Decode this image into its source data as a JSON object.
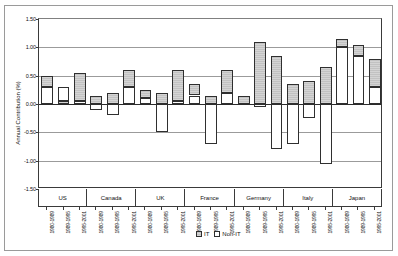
{
  "chart_data": {
    "type": "bar",
    "subtype": "stacked-column-grouped",
    "title": "",
    "xlabel": "",
    "ylabel": "Annual Contribution (%)",
    "ylim": [
      -1.5,
      1.5
    ],
    "ytick_values": [
      1.5,
      1.0,
      0.5,
      0.0,
      -0.5,
      -1.0,
      -1.5
    ],
    "ytick_labels": [
      "1.50",
      "1.00",
      "0.50",
      "0.00",
      "-0.50",
      "-1.00",
      "-1.50"
    ],
    "grid": true,
    "legend_position": "bottom-center",
    "legend": [
      "IT",
      "Non-IT"
    ],
    "colors": {
      "IT": "#c2c2c2",
      "Non-IT": "#ffffff",
      "outline": "#2f2f2f",
      "gridline": "#9b9b9b",
      "axis": "#3a3a3a"
    },
    "categories": [
      "US",
      "Canada",
      "UK",
      "France",
      "Germany",
      "Italy",
      "Japan"
    ],
    "periods": [
      "1980-1989",
      "1989-1995",
      "1995-2001"
    ],
    "series": [
      {
        "name": "IT",
        "values": [
          [
            0.2,
            0.05,
            0.05
          ],
          [
            0.15,
            0.2,
            0.3
          ],
          [
            0.15,
            0.2,
            0.55
          ],
          [
            0.2,
            0.15,
            0.4
          ],
          [
            0.15,
            1.1,
            0.15
          ],
          [
            0.35,
            0.4,
            0.65
          ],
          [
            0.15,
            0.2,
            0.5
          ]
        ]
      },
      {
        "name": "Non-IT",
        "values": [
          [
            0.3,
            0.25,
            0.5
          ],
          [
            -0.1,
            -0.2,
            0.3
          ],
          [
            0.1,
            -0.5,
            0.05
          ],
          [
            0.15,
            -0.7,
            0.2
          ],
          [
            0.0,
            -0.05,
            -0.8
          ],
          [
            -0.7,
            -0.25,
            -1.05
          ],
          [
            1.0,
            0.85,
            0.3
          ]
        ]
      }
    ],
    "bars": [
      {
        "country": "US",
        "period": "1980-1989",
        "it_bottom": 0.3,
        "it_top": 0.5,
        "nonit_bottom": 0.0,
        "nonit_top": 0.3
      },
      {
        "country": "US",
        "period": "1989-1995",
        "it_bottom": 0.0,
        "it_top": 0.05,
        "nonit_bottom": 0.05,
        "nonit_top": 0.3
      },
      {
        "country": "US",
        "period": "1995-2001",
        "it_bottom": 0.05,
        "it_top": 0.55,
        "nonit_bottom": 0.0,
        "nonit_top": 0.05
      },
      {
        "country": "Canada",
        "period": "1980-1989",
        "it_bottom": 0.0,
        "it_top": 0.15,
        "nonit_bottom": -0.1,
        "nonit_top": 0.0
      },
      {
        "country": "Canada",
        "period": "1989-1995",
        "it_bottom": 0.0,
        "it_top": 0.2,
        "nonit_bottom": -0.2,
        "nonit_top": 0.0
      },
      {
        "country": "Canada",
        "period": "1995-2001",
        "it_bottom": 0.3,
        "it_top": 0.6,
        "nonit_bottom": 0.0,
        "nonit_top": 0.3
      },
      {
        "country": "UK",
        "period": "1980-1989",
        "it_bottom": 0.1,
        "it_top": 0.25,
        "nonit_bottom": 0.0,
        "nonit_top": 0.1
      },
      {
        "country": "UK",
        "period": "1989-1995",
        "it_bottom": 0.0,
        "it_top": 0.2,
        "nonit_bottom": -0.5,
        "nonit_top": 0.0
      },
      {
        "country": "UK",
        "period": "1995-2001",
        "it_bottom": 0.05,
        "it_top": 0.6,
        "nonit_bottom": 0.0,
        "nonit_top": 0.05
      },
      {
        "country": "France",
        "period": "1980-1989",
        "it_bottom": 0.15,
        "it_top": 0.35,
        "nonit_bottom": 0.0,
        "nonit_top": 0.15
      },
      {
        "country": "France",
        "period": "1989-1995",
        "it_bottom": 0.0,
        "it_top": 0.15,
        "nonit_bottom": -0.7,
        "nonit_top": 0.0
      },
      {
        "country": "France",
        "period": "1995-2001",
        "it_bottom": 0.2,
        "it_top": 0.6,
        "nonit_bottom": 0.0,
        "nonit_top": 0.2
      },
      {
        "country": "Germany",
        "period": "1980-1989",
        "it_bottom": 0.0,
        "it_top": 0.15,
        "nonit_bottom": 0.0,
        "nonit_top": 0.0
      },
      {
        "country": "Germany",
        "period": "1989-1995",
        "it_bottom": 0.0,
        "it_top": 1.1,
        "nonit_bottom": -0.05,
        "nonit_top": 0.0
      },
      {
        "country": "Germany",
        "period": "1995-2001",
        "it_bottom": 0.0,
        "it_top": 0.85,
        "nonit_bottom": -0.8,
        "nonit_top": 0.0
      },
      {
        "country": "Italy",
        "period": "1980-1989",
        "it_bottom": 0.0,
        "it_top": 0.35,
        "nonit_bottom": -0.7,
        "nonit_top": 0.0
      },
      {
        "country": "Italy",
        "period": "1989-1995",
        "it_bottom": 0.0,
        "it_top": 0.4,
        "nonit_bottom": -0.25,
        "nonit_top": 0.0
      },
      {
        "country": "Italy",
        "period": "1995-2001",
        "it_bottom": 0.0,
        "it_top": 0.65,
        "nonit_bottom": -1.05,
        "nonit_top": 0.0
      },
      {
        "country": "Japan",
        "period": "1980-1989",
        "it_bottom": 1.0,
        "it_top": 1.15,
        "nonit_bottom": 0.0,
        "nonit_top": 1.0
      },
      {
        "country": "Japan",
        "period": "1989-1995",
        "it_bottom": 0.85,
        "it_top": 1.05,
        "nonit_bottom": 0.0,
        "nonit_top": 0.85
      },
      {
        "country": "Japan",
        "period": "1995-2001",
        "it_bottom": 0.3,
        "it_top": 0.8,
        "nonit_bottom": 0.0,
        "nonit_top": 0.3
      }
    ]
  }
}
